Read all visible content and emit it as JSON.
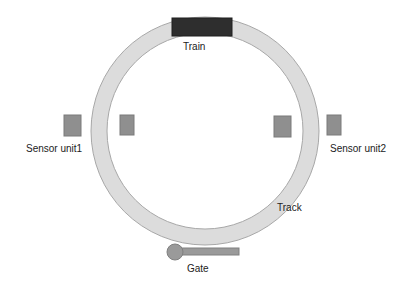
{
  "diagram": {
    "labels": {
      "train": "Train",
      "sensor_left": "Sensor unit1",
      "sensor_right": "Sensor unit2",
      "track": "Track",
      "gate": "Gate"
    },
    "colors": {
      "background": "#ffffff",
      "track_fill": "#dcdcdc",
      "track_stroke": "#a8a8a8",
      "train_fill": "#2e2e2e",
      "sensor_fill": "#8f8f8f",
      "sensor_stroke": "#7a7a7a",
      "gate_fill": "#9a9a9a",
      "gate_stroke": "#808080",
      "text": "#222222"
    },
    "components": [
      {
        "name": "track",
        "shape": "ring"
      },
      {
        "name": "train",
        "shape": "rectangle"
      },
      {
        "name": "sensor-unit1-outer",
        "shape": "rectangle"
      },
      {
        "name": "sensor-unit1-inner",
        "shape": "rectangle"
      },
      {
        "name": "sensor-unit2-inner",
        "shape": "rectangle"
      },
      {
        "name": "sensor-unit2-outer",
        "shape": "rectangle"
      },
      {
        "name": "gate",
        "shape": "circle-with-bar"
      }
    ]
  }
}
